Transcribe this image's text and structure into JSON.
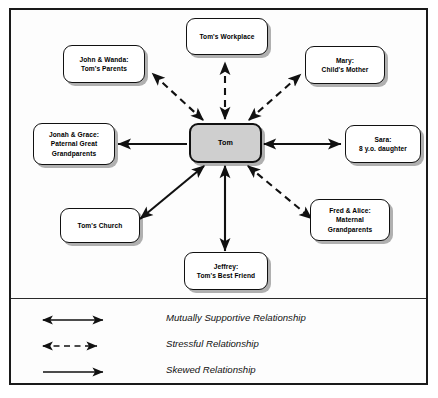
{
  "diagram": {
    "frame_color": "#1a1a1a",
    "center_fill": "#cfcfcf",
    "line_color": "#111111",
    "center": {
      "id": "tom",
      "label": "Tom"
    },
    "nodes": [
      {
        "id": "workplace",
        "label": "Tom's Workplace"
      },
      {
        "id": "parents",
        "label": "John & Wanda:\nTom's Parents"
      },
      {
        "id": "mary",
        "label": "Mary:\nChild's Mother"
      },
      {
        "id": "greatgrand",
        "label": "Jonah & Grace:\nPaternal Great\nGrandparents"
      },
      {
        "id": "sara",
        "label": "Sara:\n8 y.o. daughter"
      },
      {
        "id": "church",
        "label": "Tom's Church"
      },
      {
        "id": "jeffrey",
        "label": "Jeffrey:\nTom's Best Friend"
      },
      {
        "id": "maternalgp",
        "label": "Fred & Alice:\nMaternal\nGrandparents"
      }
    ],
    "edges": [
      {
        "from": "tom",
        "to": "workplace",
        "style": "dashed",
        "arrows": "both",
        "relationship": "Stressful Relationship"
      },
      {
        "from": "tom",
        "to": "parents",
        "style": "dashed",
        "arrows": "both",
        "relationship": "Stressful Relationship"
      },
      {
        "from": "tom",
        "to": "mary",
        "style": "dashed",
        "arrows": "both",
        "relationship": "Stressful Relationship"
      },
      {
        "from": "tom",
        "to": "maternalgp",
        "style": "dashed",
        "arrows": "both",
        "relationship": "Stressful Relationship"
      },
      {
        "from": "tom",
        "to": "greatgrand",
        "style": "solid",
        "arrows": "one",
        "relationship": "Skewed Relationship"
      },
      {
        "from": "tom",
        "to": "sara",
        "style": "solid",
        "arrows": "both",
        "relationship": "Mutually Supportive Relationship"
      },
      {
        "from": "tom",
        "to": "church",
        "style": "solid",
        "arrows": "both",
        "relationship": "Mutually Supportive Relationship"
      },
      {
        "from": "tom",
        "to": "jeffrey",
        "style": "solid",
        "arrows": "both",
        "relationship": "Mutually Supportive Relationship"
      }
    ]
  },
  "legend": {
    "items": [
      {
        "id": "mutually-supportive",
        "style": "solid",
        "arrows": "both",
        "label": "Mutually Supportive Relationship"
      },
      {
        "id": "stressful",
        "style": "dashed",
        "arrows": "both",
        "label": "Stressful Relationship"
      },
      {
        "id": "skewed",
        "style": "solid",
        "arrows": "one",
        "label": "Skewed Relationship"
      }
    ]
  }
}
